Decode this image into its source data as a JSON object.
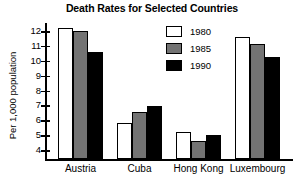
{
  "chart_data": {
    "type": "bar",
    "title": "Death Rates for Selected Countries",
    "xlabel": "",
    "ylabel": "Per 1,000 population",
    "categories": [
      "Austria",
      "Cuba",
      "Hong Kong",
      "Luxembourg"
    ],
    "series": [
      {
        "name": "1980",
        "color": "#ffffff",
        "values": [
          12.2,
          5.85,
          5.2,
          11.6
        ]
      },
      {
        "name": "1985",
        "color": "#737373",
        "values": [
          12.0,
          6.55,
          4.6,
          11.1
        ]
      },
      {
        "name": "1990",
        "color": "#000000",
        "values": [
          10.6,
          6.95,
          5.0,
          10.25
        ]
      }
    ],
    "ylim": [
      3.4,
      12.6
    ],
    "yticks": [
      4,
      5,
      6,
      7,
      8,
      9,
      10,
      11,
      12
    ],
    "ytick_labels": [
      "4",
      "5",
      "6",
      "7",
      "8",
      "9",
      "10",
      "11",
      "12"
    ],
    "grid": false,
    "legend_position": "upper center",
    "legend_entries": [
      "1980",
      "1985",
      "1990"
    ]
  }
}
